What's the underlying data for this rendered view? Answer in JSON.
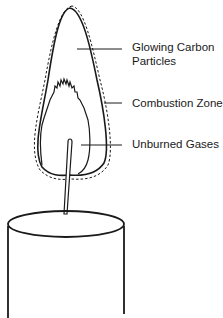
{
  "diagram": {
    "labels": [
      {
        "line1": "Glowing Carbon",
        "line2": "Particles"
      },
      {
        "line1": "Combustion Zone"
      },
      {
        "line1": "Unburned Gases"
      }
    ],
    "colors": {
      "ink": "#1a1a1a",
      "background": "#ffffff"
    }
  }
}
